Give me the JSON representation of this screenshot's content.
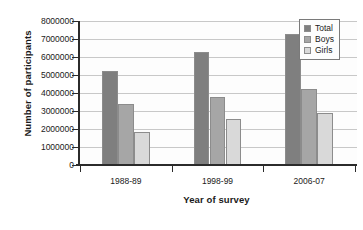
{
  "chart_data": {
    "type": "bar",
    "title": "",
    "xlabel": "Year of survey",
    "ylabel": "Number of participants",
    "categories": [
      "1988-89",
      "1998-99",
      "2006-07"
    ],
    "series": [
      {
        "name": "Total",
        "values": [
          5200000,
          6300000,
          7300000
        ],
        "color": "#7f7f7f"
      },
      {
        "name": "Boys",
        "values": [
          3400000,
          3800000,
          4250000
        ],
        "color": "#a6a6a6"
      },
      {
        "name": "Girls",
        "values": [
          1850000,
          2550000,
          2900000
        ],
        "color": "#d9d9d9"
      }
    ],
    "ylim": [
      0,
      8000000
    ],
    "ytick_labels": [
      "8000000",
      "7000000",
      "6000000",
      "5000000",
      "4000000",
      "3000000",
      "2000000",
      "1000000",
      "0"
    ],
    "ytick_values": [
      8000000,
      7000000,
      6000000,
      5000000,
      4000000,
      3000000,
      2000000,
      1000000,
      0
    ],
    "grid": true,
    "legend_position": "top-right",
    "legend_entries": [
      "Total",
      "Boys",
      "Girls"
    ]
  },
  "colors": {
    "axis": "#2b2b2b",
    "gridline": "#c8c8c8",
    "plot_background": "#fdfdfd",
    "text": "#1a1a1a"
  }
}
